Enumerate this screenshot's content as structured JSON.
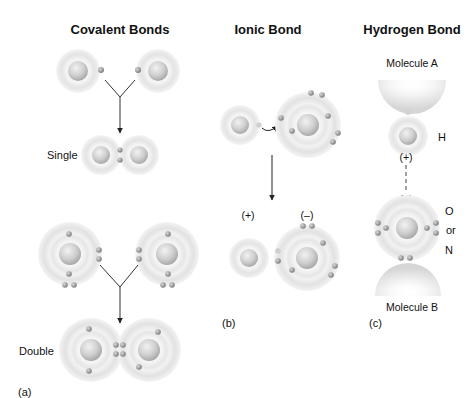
{
  "panels": {
    "covalent": {
      "title": "Covalent Bonds",
      "single_label": "Single",
      "double_label": "Double",
      "panel_label": "(a)"
    },
    "ionic": {
      "title": "Ionic Bond",
      "positive_label": "(+)",
      "negative_label": "(–)",
      "panel_label": "(b)"
    },
    "hydrogen": {
      "title": "Hydrogen Bond",
      "molecule_a": "Molecule A",
      "molecule_b": "Molecule B",
      "h_label": "H",
      "positive_label": "(+)",
      "negative_label": "(–)",
      "o_label": "O",
      "or_label": "or",
      "n_label": "N",
      "panel_label": "(c)"
    }
  },
  "colors": {
    "background": "#ffffff",
    "shell_outer": "#e6e6e6",
    "shell_inner": "#f4f4f4",
    "nucleus": "#c8c8c8",
    "electron": "#9a9a9a",
    "line": "#333333",
    "text": "#111111"
  }
}
